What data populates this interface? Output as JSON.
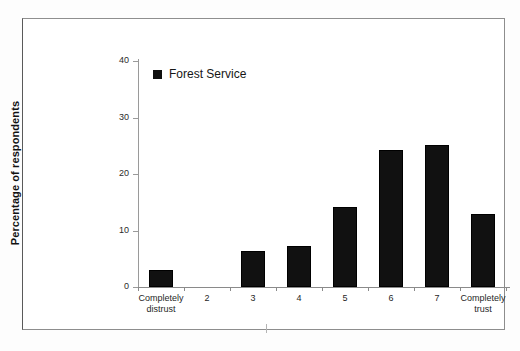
{
  "chart_data": {
    "type": "bar",
    "title": "",
    "xlabel": "",
    "ylabel": "Percentage of respondents",
    "ylim": [
      0,
      40
    ],
    "ytick_labels": [
      "0",
      "10",
      "20",
      "30",
      "40"
    ],
    "ytick_values": [
      0,
      10,
      20,
      30,
      40
    ],
    "grid": false,
    "legend_position": "top-left-inside",
    "categories": [
      "Completely\ndistrust",
      "2",
      "3",
      "4",
      "5",
      "6",
      "7",
      "Completely\ntrust"
    ],
    "series": [
      {
        "name": "Forest Service",
        "color": "#111111",
        "values": [
          3,
          0,
          6.4,
          7.3,
          14.2,
          24.2,
          25.2,
          13
        ]
      }
    ]
  },
  "legend": {
    "label": "Forest Service",
    "swatch_color": "#111111"
  },
  "axis": {
    "y_title": "Percentage of respondents"
  },
  "caption": {
    "text": ""
  }
}
